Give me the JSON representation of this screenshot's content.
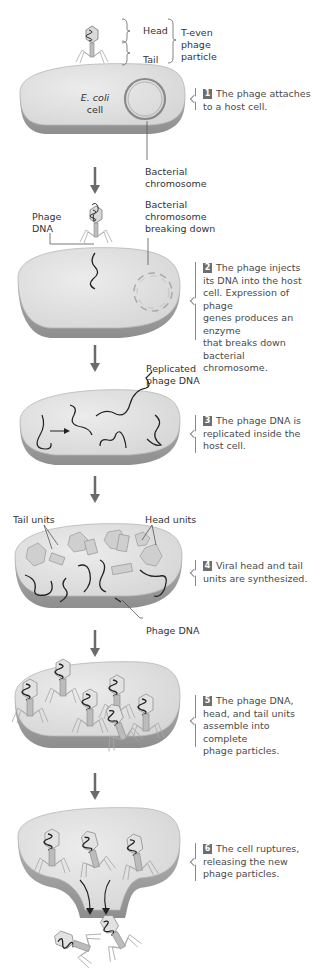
{
  "figure": {
    "title_labels": {
      "head": "Head",
      "tail": "Tail",
      "particle": [
        "T-even",
        "phage",
        "particle"
      ]
    },
    "colors": {
      "cell_fill": "#e3e3e3",
      "cell_edge": "#a9a9a9",
      "dna": "#2a2a2a",
      "arrow": "#6a6a6a",
      "badge": "#6e6e6e"
    },
    "steps": [
      {
        "number": "1",
        "text": [
          "The phage attaches",
          "to a host cell."
        ],
        "labels": {
          "cell_1": "E. coli",
          "cell_2": "cell",
          "chromosome": [
            "Bacterial",
            "chromosome"
          ]
        }
      },
      {
        "number": "2",
        "text": [
          "The phage injects",
          "its DNA into the host",
          "cell. Expression of phage",
          "genes produces an enzyme",
          "that breaks down bacterial",
          "chromosome."
        ],
        "labels": {
          "phage_dna": [
            "Phage",
            "DNA"
          ],
          "chromosome_breaking": [
            "Bacterial",
            "chromosome",
            "breaking down"
          ]
        }
      },
      {
        "number": "3",
        "text": [
          "The phage DNA is",
          "replicated inside the",
          "host cell."
        ],
        "labels": {
          "replicated": [
            "Replicated",
            "phage DNA"
          ]
        }
      },
      {
        "number": "4",
        "text": [
          "Viral head and tail",
          "units are synthesized."
        ],
        "labels": {
          "tail_units": "Tail units",
          "head_units": "Head units",
          "phage_dna": "Phage DNA"
        }
      },
      {
        "number": "5",
        "text": [
          "The phage DNA,",
          "head, and tail units",
          "assemble into complete",
          "phage particles."
        ]
      },
      {
        "number": "6",
        "text": [
          "The cell ruptures,",
          "releasing the new",
          "phage particles."
        ]
      }
    ]
  }
}
